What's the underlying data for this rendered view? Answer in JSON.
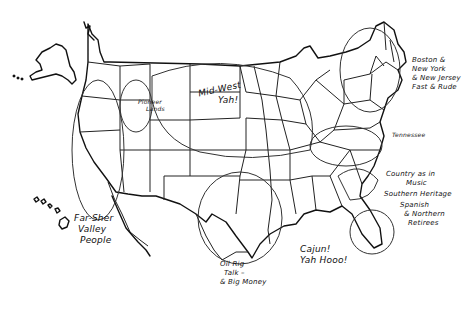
{
  "map": {
    "title": "Hand-drawn US dialect regions map",
    "background": "#ffffff",
    "ink_color": "#111111",
    "labels": {
      "northeast": [
        "Boston &",
        "New York",
        "& New Jersey",
        "Fast & Rude"
      ],
      "midwest": [
        "Mid-West",
        "Yah!"
      ],
      "pioneer": [
        "Pioneer",
        "Lands"
      ],
      "tennessee": "Tennessee",
      "country": [
        "Country as in",
        "Music"
      ],
      "southern": "Southern Heritage",
      "spanish": [
        "Spanish",
        "& Northern",
        "Retirees"
      ],
      "pacific": [
        "Far-Sher",
        "Valley",
        "People"
      ],
      "texas": [
        "Oil Rig",
        "Talk –",
        "& Big Money"
      ],
      "cajun": [
        "Cajun!",
        "Yah Hooo!"
      ]
    }
  }
}
